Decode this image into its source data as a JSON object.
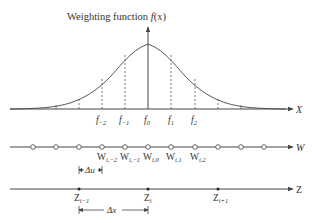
{
  "title": {
    "prefix": "Weighting function ",
    "func": "f",
    "arg": "(x)"
  },
  "axes": {
    "x_label": "X",
    "w_label": "W",
    "z_label": "Z"
  },
  "f_labels": [
    {
      "base": "f",
      "sub": "−2"
    },
    {
      "base": "f",
      "sub": "−1"
    },
    {
      "base": "f",
      "sub": "0"
    },
    {
      "base": "f",
      "sub": "1"
    },
    {
      "base": "f",
      "sub": "2"
    }
  ],
  "w_labels": [
    {
      "base": "W",
      "sub": "i,−2"
    },
    {
      "base": "W",
      "sub": "i,−1"
    },
    {
      "base": "W",
      "sub": "i,0"
    },
    {
      "base": "W",
      "sub": "i,1"
    },
    {
      "base": "W",
      "sub": "i,2"
    }
  ],
  "z_labels": [
    {
      "base": "Z",
      "sub": "i−1"
    },
    {
      "base": "Z",
      "sub": "i"
    },
    {
      "base": "Z",
      "sub": "i+1"
    }
  ],
  "spacing_labels": {
    "delta_u": "Δu",
    "delta_x": "Δx"
  },
  "colors": {
    "line": "#444444",
    "text": "#333333",
    "background": "#ffffff"
  }
}
